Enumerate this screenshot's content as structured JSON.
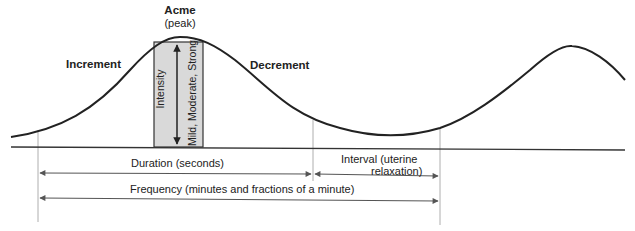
{
  "diagram": {
    "labels": {
      "acme": "Acme",
      "peak": "(peak)",
      "increment": "Increment",
      "decrement": "Decrement",
      "intensity": "Intensity",
      "intensity_levels": "Mild, Moderate, Strong",
      "duration": "Duration (seconds)",
      "interval_line1": "Interval (uterine",
      "interval_line2": "relaxation)",
      "frequency": "Frequency (minutes and fractions of a minute)"
    },
    "colors": {
      "line": "#222222",
      "intensity_box": "#d9d9d9",
      "guide": "#888888",
      "arrow": "#555555"
    }
  }
}
